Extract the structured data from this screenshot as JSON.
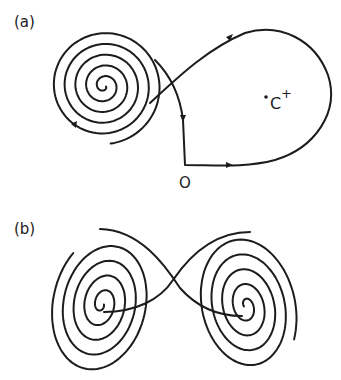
{
  "panels": {
    "a": {
      "label": "(a)",
      "origin_label": "O",
      "fixed_point_label": "C",
      "fixed_point_sup": "+",
      "description": "Homoclinic orbit from origin O looping around C+, spiraling into the left focus"
    },
    "b": {
      "label": "(b)",
      "description": "Two spiral foci connected by a figure-eight trajectory"
    }
  },
  "colors": {
    "stroke": "#1c1c1c",
    "background": "#ffffff"
  }
}
